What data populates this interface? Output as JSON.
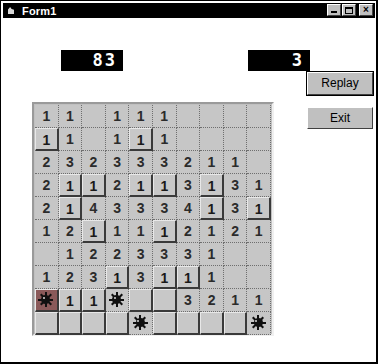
{
  "window": {
    "title": "Form1",
    "icon": "app-icon",
    "buttons": {
      "minimize": "_",
      "maximize": "□",
      "close": "×"
    }
  },
  "counters": {
    "left_label": "83",
    "right_label": "3"
  },
  "actions": {
    "replay_label": "Replay",
    "exit_label": "Exit"
  },
  "colors": {
    "window_bg": "#ffffff",
    "face": "#c0c0c0",
    "cell_face": "#c6c6c6",
    "led_bg": "#000000",
    "led_fg": "#ffffff",
    "titlebar_bg": "#000000",
    "titlebar_fg": "#ffffff",
    "number_fg": "#2b2b2b",
    "exploded_bg": "#8a5a5a"
  },
  "board": {
    "rows": 10,
    "cols": 10,
    "legend": {
      "revealed": "flat cell showing adjacent-mine count",
      "raised": "covered cell (3D raised)",
      "mine": "revealed mine",
      "exploded": "mine that was detonated"
    },
    "cells": [
      [
        {
          "state": "revealed",
          "value": "1"
        },
        {
          "state": "revealed",
          "value": "1"
        },
        {
          "state": "revealed",
          "value": ""
        },
        {
          "state": "revealed",
          "value": "1"
        },
        {
          "state": "revealed",
          "value": "1"
        },
        {
          "state": "revealed",
          "value": "1"
        },
        {
          "state": "revealed",
          "value": ""
        },
        {
          "state": "revealed",
          "value": ""
        },
        {
          "state": "revealed",
          "value": ""
        },
        {
          "state": "revealed",
          "value": ""
        }
      ],
      [
        {
          "state": "raised",
          "value": "1"
        },
        {
          "state": "revealed",
          "value": "1"
        },
        {
          "state": "revealed",
          "value": ""
        },
        {
          "state": "revealed",
          "value": "1"
        },
        {
          "state": "raised",
          "value": "1"
        },
        {
          "state": "revealed",
          "value": "1"
        },
        {
          "state": "revealed",
          "value": ""
        },
        {
          "state": "revealed",
          "value": ""
        },
        {
          "state": "revealed",
          "value": ""
        },
        {
          "state": "revealed",
          "value": ""
        }
      ],
      [
        {
          "state": "revealed",
          "value": "2"
        },
        {
          "state": "revealed",
          "value": "3"
        },
        {
          "state": "revealed",
          "value": "2"
        },
        {
          "state": "revealed",
          "value": "3"
        },
        {
          "state": "revealed",
          "value": "3"
        },
        {
          "state": "revealed",
          "value": "3"
        },
        {
          "state": "revealed",
          "value": "2"
        },
        {
          "state": "revealed",
          "value": "1"
        },
        {
          "state": "revealed",
          "value": "1"
        },
        {
          "state": "revealed",
          "value": ""
        }
      ],
      [
        {
          "state": "revealed",
          "value": "2"
        },
        {
          "state": "raised",
          "value": "1"
        },
        {
          "state": "raised",
          "value": "1"
        },
        {
          "state": "revealed",
          "value": "2"
        },
        {
          "state": "raised",
          "value": "1"
        },
        {
          "state": "raised",
          "value": "1"
        },
        {
          "state": "revealed",
          "value": "3"
        },
        {
          "state": "raised",
          "value": "1"
        },
        {
          "state": "revealed",
          "value": "3"
        },
        {
          "state": "revealed",
          "value": "1"
        }
      ],
      [
        {
          "state": "revealed",
          "value": "2"
        },
        {
          "state": "raised",
          "value": "1"
        },
        {
          "state": "revealed",
          "value": "4"
        },
        {
          "state": "revealed",
          "value": "3"
        },
        {
          "state": "revealed",
          "value": "3"
        },
        {
          "state": "revealed",
          "value": "3"
        },
        {
          "state": "revealed",
          "value": "4"
        },
        {
          "state": "raised",
          "value": "1"
        },
        {
          "state": "revealed",
          "value": "3"
        },
        {
          "state": "raised",
          "value": "1"
        }
      ],
      [
        {
          "state": "revealed",
          "value": "1"
        },
        {
          "state": "revealed",
          "value": "2"
        },
        {
          "state": "raised",
          "value": "1"
        },
        {
          "state": "revealed",
          "value": "1"
        },
        {
          "state": "revealed",
          "value": "1"
        },
        {
          "state": "raised",
          "value": "1"
        },
        {
          "state": "revealed",
          "value": "2"
        },
        {
          "state": "revealed",
          "value": "1"
        },
        {
          "state": "revealed",
          "value": "2"
        },
        {
          "state": "revealed",
          "value": "1"
        }
      ],
      [
        {
          "state": "revealed",
          "value": ""
        },
        {
          "state": "revealed",
          "value": "1"
        },
        {
          "state": "revealed",
          "value": "2"
        },
        {
          "state": "revealed",
          "value": "2"
        },
        {
          "state": "revealed",
          "value": "3"
        },
        {
          "state": "revealed",
          "value": "3"
        },
        {
          "state": "revealed",
          "value": "3"
        },
        {
          "state": "revealed",
          "value": "1"
        },
        {
          "state": "revealed",
          "value": ""
        },
        {
          "state": "revealed",
          "value": ""
        }
      ],
      [
        {
          "state": "revealed",
          "value": "1"
        },
        {
          "state": "revealed",
          "value": "2"
        },
        {
          "state": "revealed",
          "value": "3"
        },
        {
          "state": "raised",
          "value": "1"
        },
        {
          "state": "revealed",
          "value": "3"
        },
        {
          "state": "raised",
          "value": "1"
        },
        {
          "state": "raised",
          "value": "1"
        },
        {
          "state": "revealed",
          "value": "1"
        },
        {
          "state": "revealed",
          "value": ""
        },
        {
          "state": "revealed",
          "value": ""
        }
      ],
      [
        {
          "state": "exploded",
          "value": ""
        },
        {
          "state": "raised",
          "value": "1"
        },
        {
          "state": "raised",
          "value": "1"
        },
        {
          "state": "mine",
          "value": ""
        },
        {
          "state": "raised",
          "value": ""
        },
        {
          "state": "raised",
          "value": ""
        },
        {
          "state": "revealed",
          "value": "3"
        },
        {
          "state": "revealed",
          "value": "2"
        },
        {
          "state": "revealed",
          "value": "1"
        },
        {
          "state": "revealed",
          "value": "1"
        }
      ],
      [
        {
          "state": "raised",
          "value": ""
        },
        {
          "state": "raised",
          "value": ""
        },
        {
          "state": "raised",
          "value": ""
        },
        {
          "state": "raised",
          "value": ""
        },
        {
          "state": "mine",
          "value": ""
        },
        {
          "state": "raised",
          "value": ""
        },
        {
          "state": "raised",
          "value": ""
        },
        {
          "state": "raised",
          "value": ""
        },
        {
          "state": "raised",
          "value": ""
        },
        {
          "state": "mine",
          "value": ""
        }
      ]
    ]
  }
}
